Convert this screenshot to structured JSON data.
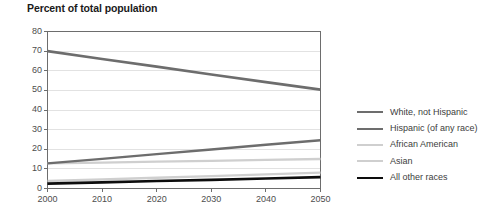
{
  "chart_data": {
    "type": "line",
    "title": "Percent of total population",
    "xlabel": "",
    "ylabel": "",
    "x": [
      2000,
      2010,
      2020,
      2030,
      2040,
      2050
    ],
    "xtick_labels": [
      "2000",
      "2010",
      "2020",
      "2030",
      "2040",
      "2050"
    ],
    "ytick_labels": [
      "0",
      "10",
      "20",
      "30",
      "40",
      "50",
      "60",
      "70",
      "80"
    ],
    "ylim": [
      0,
      80
    ],
    "xlim": [
      2000,
      2050
    ],
    "ytick_values": [
      0,
      10,
      20,
      30,
      40,
      50,
      60,
      70,
      80
    ],
    "grid": "horizontal",
    "legend_position": "right",
    "series": [
      {
        "name": "White, not Hispanic",
        "color": "#6d6d6d",
        "width": 2.6,
        "values": [
          70.0,
          66.0,
          62.1,
          58.1,
          54.2,
          50.4
        ]
      },
      {
        "name": "Hispanic (of any race)",
        "color": "#6d6d6d",
        "width": 2.4,
        "values": [
          12.8,
          15.1,
          17.5,
          19.9,
          22.3,
          24.6
        ]
      },
      {
        "name": "African American",
        "color": "#cfcfcf",
        "width": 2.4,
        "values": [
          12.8,
          13.2,
          13.7,
          14.1,
          14.6,
          15.0
        ]
      },
      {
        "name": "Asian",
        "color": "#cfcfcf",
        "width": 2.4,
        "values": [
          3.8,
          4.6,
          5.5,
          6.3,
          7.2,
          8.1
        ]
      },
      {
        "name": "All other races",
        "color": "#0d0d0d",
        "width": 2.6,
        "values": [
          2.5,
          3.1,
          3.8,
          4.4,
          5.1,
          5.8
        ]
      }
    ]
  },
  "axes": {
    "axis_color": "#6d6d6d",
    "grid_color": "#e2e2e2",
    "tick_color": "#6d6d6d"
  }
}
